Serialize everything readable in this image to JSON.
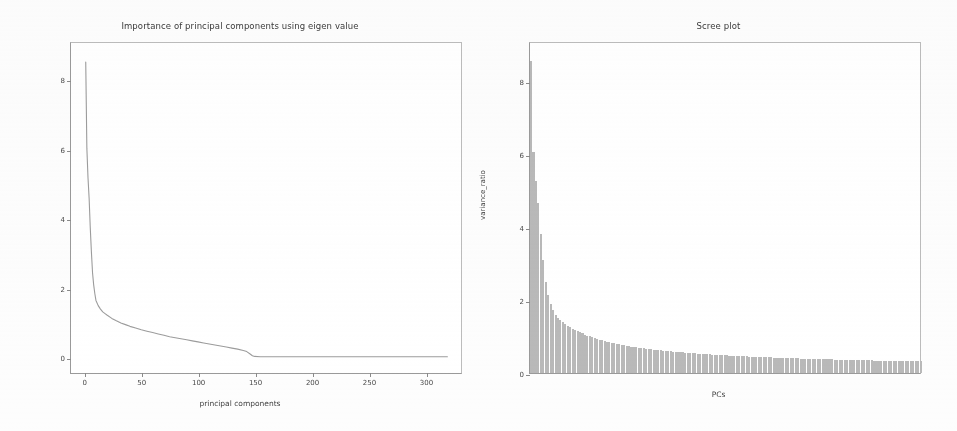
{
  "figure": {
    "background": "#ffffff",
    "line_color": "#9c9c9c",
    "bar_color": "#b9b9b9",
    "axis_color": "#9a9a9a"
  },
  "left_panel": {
    "title": "Importance of principal components using eigen value",
    "xlabel": "principal components",
    "ylabel": "Variance contribution"
  },
  "right_panel": {
    "title": "Scree plot",
    "xlabel": "PCs",
    "ylabel": "variance_ratio"
  },
  "chart_data": [
    {
      "type": "line",
      "title": "Importance of principal components using eigen value",
      "xlabel": "principal components",
      "ylabel": "Variance contribution",
      "xlim": [
        -12,
        332
      ],
      "ylim": [
        -0.45,
        9.1
      ],
      "xticks": [
        0,
        50,
        100,
        150,
        200,
        250,
        300
      ],
      "xtick_labels": [
        "0",
        "50",
        "100",
        "150",
        "200",
        "250",
        "300"
      ],
      "yticks": [
        0,
        2,
        4,
        6,
        8
      ],
      "ytick_labels": [
        "0",
        "2",
        "4",
        "6",
        "8"
      ],
      "grid": false,
      "legend": false,
      "series": [
        {
          "name": "eigen value",
          "x": [
            1,
            2,
            3,
            4,
            5,
            6,
            7,
            8,
            9,
            10,
            12,
            14,
            16,
            18,
            20,
            24,
            28,
            32,
            36,
            40,
            45,
            50,
            55,
            60,
            65,
            70,
            75,
            80,
            85,
            90,
            95,
            100,
            105,
            110,
            115,
            120,
            125,
            130,
            135,
            140,
            143,
            146,
            148,
            150,
            155,
            160,
            170,
            180,
            190,
            200,
            220,
            240,
            260,
            280,
            300,
            320
          ],
          "y": [
            8.55,
            6.05,
            5.2,
            4.6,
            3.75,
            3.05,
            2.45,
            2.1,
            1.85,
            1.65,
            1.5,
            1.4,
            1.32,
            1.27,
            1.22,
            1.13,
            1.06,
            1.0,
            0.95,
            0.9,
            0.85,
            0.8,
            0.76,
            0.72,
            0.68,
            0.64,
            0.6,
            0.57,
            0.54,
            0.51,
            0.48,
            0.45,
            0.42,
            0.39,
            0.36,
            0.33,
            0.3,
            0.27,
            0.24,
            0.2,
            0.17,
            0.1,
            0.05,
            0.03,
            0.02,
            0.02,
            0.02,
            0.02,
            0.02,
            0.02,
            0.02,
            0.02,
            0.02,
            0.02,
            0.02,
            0.02
          ]
        }
      ]
    },
    {
      "type": "bar",
      "title": "Scree plot",
      "xlabel": "PCs",
      "ylabel": "variance_ratio",
      "xlim": [
        0,
        320
      ],
      "ylim": [
        0,
        9.1
      ],
      "yticks": [
        0,
        2,
        4,
        6,
        8
      ],
      "ytick_labels": [
        "0",
        "2",
        "4",
        "6",
        "8"
      ],
      "xticks": [],
      "xtick_labels": [],
      "grid": false,
      "legend": false,
      "bar_count": 160,
      "categories": [
        "PC1",
        "PC2",
        "PC3",
        "PC4",
        "PC5",
        "PC6",
        "PC7",
        "PC8",
        "PC9",
        "PC10",
        "PC11",
        "PC12",
        "PC13",
        "PC14",
        "PC15",
        "PC16",
        "PC17",
        "PC18",
        "PC19",
        "PC20"
      ],
      "values": [
        8.55,
        6.05,
        5.25,
        4.65,
        3.8,
        3.1,
        2.5,
        2.15,
        1.9,
        1.72,
        1.6,
        1.52,
        1.46,
        1.4,
        1.35,
        1.3,
        1.26,
        1.22,
        1.18,
        1.15
      ]
    }
  ]
}
